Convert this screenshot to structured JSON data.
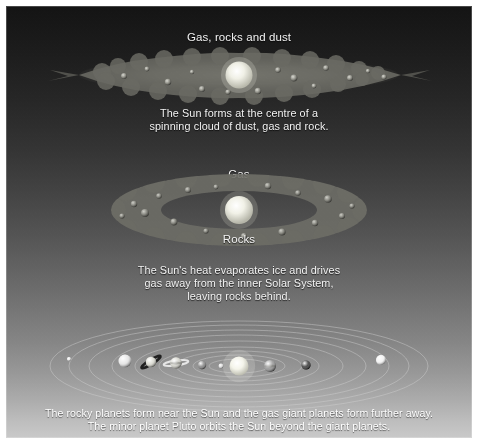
{
  "figure": {
    "width": 478,
    "height": 444
  },
  "palette": {
    "sky_top": "#141414",
    "sky_bottom": "#c9c9c9",
    "caption_text": "#f2f2f2",
    "footer_text": "#ffffff",
    "sun": "#f2f2ea",
    "dust_cloud": "#5a5a5a",
    "orbit_line": "#c9c9c9"
  },
  "stages": {
    "one": {
      "label": "Gas, rocks and dust",
      "caption": "The Sun forms at the centre of a\nspinning cloud of dust, gas and rock."
    },
    "two": {
      "label_top": "Gas",
      "label_bottom": "Rocks",
      "caption": "The Sun's heat evaporates ice and drives\ngas away from the inner Solar System,\nleaving rocks behind."
    },
    "three": {
      "caption": "The rocky planets form near the Sun and the gas giant planets form further away.\nThe minor planet Pluto orbits the Sun beyond the giant planets."
    }
  },
  "solar_system": {
    "sun": {
      "cx": 233,
      "cy": 42,
      "r": 9.5,
      "color": "#f4f4ec"
    },
    "orbits": [
      {
        "name": "mercury-orbit",
        "rx": 30,
        "ry": 7
      },
      {
        "name": "venus-orbit",
        "rx": 46,
        "ry": 11
      },
      {
        "name": "earth-orbit",
        "rx": 63,
        "ry": 15
      },
      {
        "name": "mars-orbit",
        "rx": 80,
        "ry": 19
      },
      {
        "name": "jupiter-orbit",
        "rx": 104,
        "ry": 25
      },
      {
        "name": "saturn-orbit",
        "rx": 127,
        "ry": 31
      },
      {
        "name": "uranus-orbit",
        "rx": 150,
        "ry": 36
      },
      {
        "name": "neptune-orbit",
        "rx": 170,
        "ry": 41
      },
      {
        "name": "pluto-orbit",
        "rx": 189,
        "ry": 45
      }
    ],
    "planets": [
      {
        "name": "pluto",
        "cx": 63,
        "cy": 35,
        "r": 2.0,
        "color": "#e8e8e8",
        "ring": "none"
      },
      {
        "name": "neptune",
        "cx": 119,
        "cy": 37,
        "r": 6.5,
        "color": "#e2e2e2",
        "ring": "none"
      },
      {
        "name": "saturn",
        "cx": 145,
        "cy": 38,
        "r": 5.2,
        "color": "#d6d6cc",
        "ring": "tilted"
      },
      {
        "name": "uranus",
        "cx": 170,
        "cy": 39,
        "r": 5.8,
        "color": "#cfcfc6",
        "ring": "flat"
      },
      {
        "name": "mars",
        "cx": 196,
        "cy": 41,
        "r": 4.2,
        "color": "#7c7c7c",
        "ring": "none"
      },
      {
        "name": "earth",
        "cx": 215,
        "cy": 42,
        "r": 2.4,
        "color": "#d8d8d8",
        "ring": "none"
      },
      {
        "name": "jupiter",
        "cx": 264,
        "cy": 42,
        "r": 6.0,
        "color": "#8e8e8e",
        "ring": "none"
      },
      {
        "name": "venus",
        "cx": 300,
        "cy": 41,
        "r": 4.6,
        "color": "#2b2b2b",
        "ring": "none"
      },
      {
        "name": "mercury",
        "cx": 375,
        "cy": 36,
        "r": 5.0,
        "color": "#f0f0f0",
        "ring": "none"
      }
    ]
  }
}
